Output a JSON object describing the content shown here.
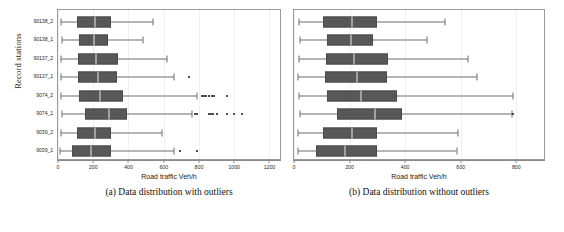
{
  "figure": {
    "ylabel": "Record stations",
    "stations": [
      "90138_2",
      "90138_1",
      "90137_2",
      "90137_1",
      "9074_2",
      "9074_1",
      "9039_2",
      "9039_1"
    ]
  },
  "panels": [
    {
      "id": "panel-with-outliers",
      "caption": "(a) Data distribution with outliers",
      "xlabel": "Road traffic Veh/h",
      "xticks": [
        0,
        200,
        400,
        600,
        800,
        1000,
        1200
      ],
      "xlim": [
        0,
        1260
      ]
    },
    {
      "id": "panel-without-outliers",
      "caption": "(b) Data distribution without outliers",
      "xlabel": "Road traffic Veh/h",
      "xticks": [
        0,
        200,
        400,
        600,
        800
      ],
      "xlim": [
        0,
        900
      ]
    }
  ],
  "chart_data": [
    {
      "type": "box",
      "title": "(a) Data distribution with outliers",
      "xlabel": "Road traffic Veh/h",
      "ylabel": "Record stations",
      "orientation": "horizontal",
      "xlim": [
        0,
        1260
      ],
      "xticks": [
        0,
        200,
        400,
        600,
        800,
        1000,
        1200
      ],
      "grid": false,
      "legend": "none",
      "categories": [
        "90138_2",
        "90138_1",
        "90137_2",
        "90137_1",
        "9074_2",
        "9074_1",
        "9039_2",
        "9039_1"
      ],
      "boxes": [
        {
          "category": "90138_2",
          "whisker_low": 18,
          "q1": 105,
          "median": 210,
          "q3": 300,
          "whisker_high": 540,
          "outliers": []
        },
        {
          "category": "90138_1",
          "whisker_low": 20,
          "q1": 118,
          "median": 205,
          "q3": 285,
          "whisker_high": 480,
          "outliers": []
        },
        {
          "category": "90137_2",
          "whisker_low": 18,
          "q1": 115,
          "median": 215,
          "q3": 340,
          "whisker_high": 620,
          "outliers": []
        },
        {
          "category": "90137_1",
          "whisker_low": 16,
          "q1": 112,
          "median": 225,
          "q3": 335,
          "whisker_high": 660,
          "outliers": [
            745
          ]
        },
        {
          "category": "9074_2",
          "whisker_low": 18,
          "q1": 120,
          "median": 240,
          "q3": 370,
          "whisker_high": 790,
          "outliers": [
            815,
            828,
            840,
            855,
            872,
            885,
            960
          ]
        },
        {
          "category": "9074_1",
          "whisker_low": 20,
          "q1": 155,
          "median": 290,
          "q3": 390,
          "whisker_high": 760,
          "outliers": [
            775,
            790,
            855,
            868,
            880,
            905,
            960,
            1000,
            1045
          ]
        },
        {
          "category": "9039_2",
          "whisker_low": 16,
          "q1": 105,
          "median": 210,
          "q3": 300,
          "whisker_high": 590,
          "outliers": []
        },
        {
          "category": "9039_1",
          "whisker_low": 14,
          "q1": 78,
          "median": 185,
          "q3": 300,
          "whisker_high": 660,
          "outliers": [
            690,
            790
          ]
        }
      ]
    },
    {
      "type": "box",
      "title": "(b) Data distribution without outliers",
      "xlabel": "Road traffic Veh/h",
      "ylabel": "Record stations",
      "orientation": "horizontal",
      "xlim": [
        0,
        900
      ],
      "xticks": [
        0,
        200,
        400,
        600,
        800
      ],
      "grid": false,
      "legend": "none",
      "categories": [
        "90138_2",
        "90138_1",
        "90137_2",
        "90137_1",
        "9074_2",
        "9074_1",
        "9039_2",
        "9039_1"
      ],
      "boxes": [
        {
          "category": "90138_2",
          "whisker_low": 18,
          "q1": 105,
          "median": 210,
          "q3": 300,
          "whisker_high": 545,
          "outliers": []
        },
        {
          "category": "90138_1",
          "whisker_low": 20,
          "q1": 118,
          "median": 205,
          "q3": 285,
          "whisker_high": 480,
          "outliers": []
        },
        {
          "category": "90137_2",
          "whisker_low": 18,
          "q1": 115,
          "median": 215,
          "q3": 340,
          "whisker_high": 625,
          "outliers": []
        },
        {
          "category": "90137_1",
          "whisker_low": 16,
          "q1": 112,
          "median": 225,
          "q3": 335,
          "whisker_high": 660,
          "outliers": []
        },
        {
          "category": "9074_2",
          "whisker_low": 18,
          "q1": 120,
          "median": 240,
          "q3": 370,
          "whisker_high": 790,
          "outliers": []
        },
        {
          "category": "9074_1",
          "whisker_low": 20,
          "q1": 155,
          "median": 290,
          "q3": 390,
          "whisker_high": 785,
          "outliers": [
            790
          ]
        },
        {
          "category": "9039_2",
          "whisker_low": 16,
          "q1": 105,
          "median": 210,
          "q3": 300,
          "whisker_high": 590,
          "outliers": []
        },
        {
          "category": "9039_1",
          "whisker_low": 14,
          "q1": 78,
          "median": 185,
          "q3": 300,
          "whisker_high": 585,
          "outliers": []
        }
      ]
    }
  ]
}
